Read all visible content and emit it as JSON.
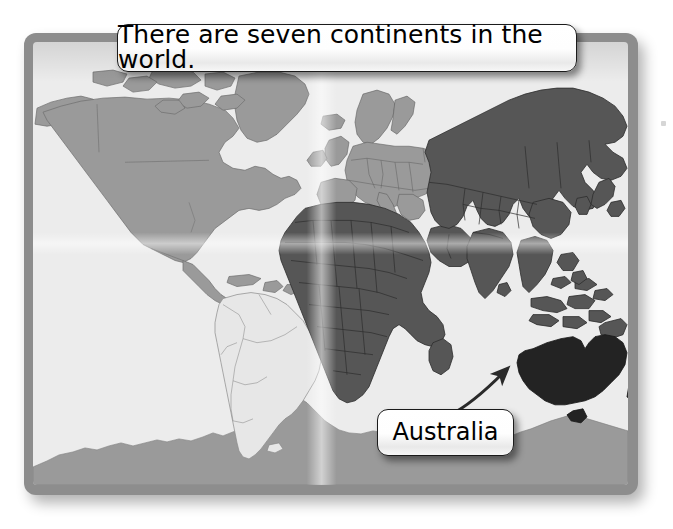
{
  "page": {
    "title_callout": "There are seven continents in the world.",
    "label_callout": "Australia",
    "background_color": "#ffffff"
  },
  "map": {
    "frame_color": "#8d8d8d",
    "ocean_color": "#ececec",
    "border_radius_px": 12,
    "continents": [
      {
        "name": "North America",
        "shade": "medium",
        "color": "#9a9a9a",
        "highlighted": false
      },
      {
        "name": "South America",
        "shade": "very-light",
        "color": "#e3e3e3",
        "highlighted": false
      },
      {
        "name": "Europe",
        "shade": "medium",
        "color": "#9a9a9a",
        "highlighted": false
      },
      {
        "name": "Africa",
        "shade": "dark",
        "color": "#565656",
        "highlighted": false
      },
      {
        "name": "Asia",
        "shade": "dark",
        "color": "#565656",
        "highlighted": false
      },
      {
        "name": "Australia",
        "shade": "near-black",
        "color": "#232323",
        "highlighted": true
      },
      {
        "name": "Antarctica",
        "shade": "medium",
        "color": "#9a9a9a",
        "highlighted": false
      }
    ],
    "continent_count": 7,
    "outline_color": "#6f6f6f"
  },
  "annotation": {
    "arrow": {
      "name": "curved-arrow",
      "color": "#2a2a2a",
      "from_x": 450,
      "from_y": 414,
      "to_x": 509,
      "to_y": 367,
      "points_to": "Australia"
    }
  }
}
